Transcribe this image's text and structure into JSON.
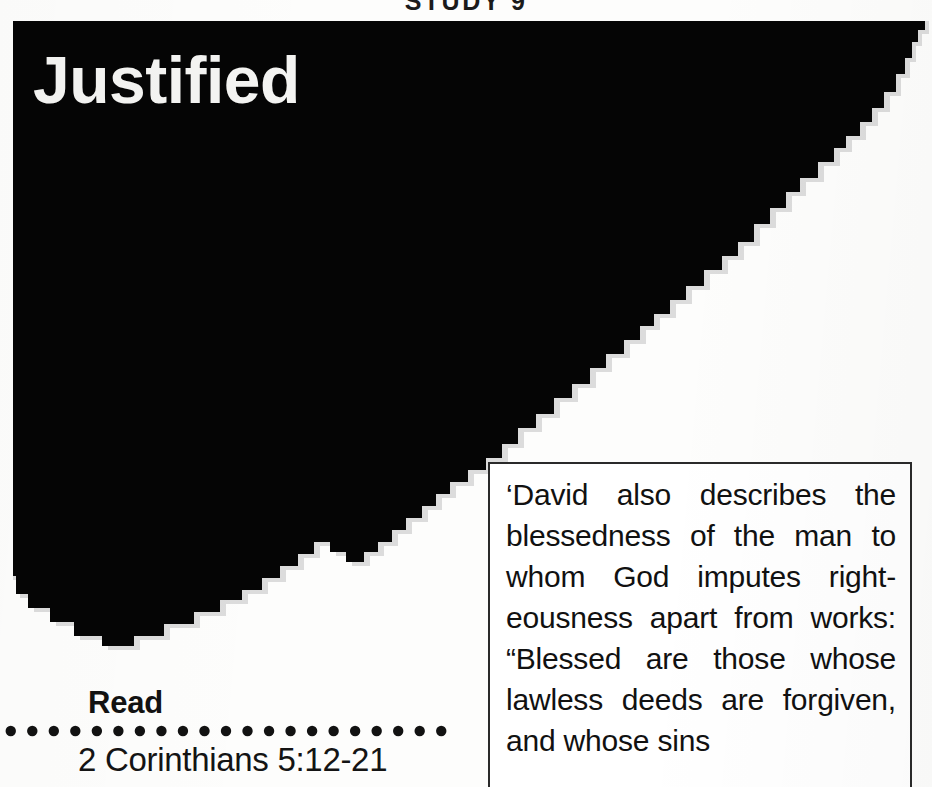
{
  "page": {
    "width": 932,
    "height": 787,
    "background_color": "#ffffff",
    "ink_color": "#000000",
    "shadow_color": "#d8d8d8"
  },
  "running_head": {
    "text": "STUDY 9",
    "note": "cropped at top edge of page; only the lower tips of the glyphs are visible"
  },
  "artwork": {
    "name": "torn-edge-black-panel",
    "fill": "#050505",
    "shadow_fill": "#dcdcdc"
  },
  "title": {
    "text": "Justified",
    "color": "#f4f4f2"
  },
  "read_section": {
    "label": "Read",
    "reference": "2 Corinthians 5:12-21",
    "dot_count": 21,
    "dot_color": "#121212"
  },
  "quote": {
    "text": "‘David also describes the blessedness of the man to whom God imputes right-eousness apart from works: “Blessed are those whose lawless deeds are forgiven, and whose sins",
    "border_color": "#2a2a2a"
  }
}
